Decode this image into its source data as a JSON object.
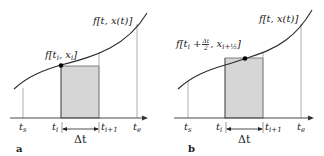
{
  "colors": {
    "curve": "#2a2a2a",
    "axis": "#333333",
    "guide": "#9a9a9a",
    "fill": "#d6d6d6",
    "dot": "#000000"
  },
  "panels": [
    {
      "id": "a",
      "tag": "a",
      "curve_label": "f[t, x(t)]",
      "point_label": "f[t_i, x_i]",
      "method": "left-endpoint (Euler)",
      "ticks": [
        "t_s",
        "t_i",
        "t_i+1",
        "t_e"
      ],
      "interval_label": "Δt"
    },
    {
      "id": "b",
      "tag": "b",
      "curve_label": "f[t, x(t)]",
      "point_label": "f[t_i + Δt/2, x_i+1/2]",
      "method": "midpoint",
      "ticks": [
        "t_s",
        "t_i",
        "t_i+1",
        "t_e"
      ],
      "interval_label": "Δt"
    }
  ],
  "text": {
    "a_tag": "a",
    "b_tag": "b",
    "curve_f": "f[t, x(t)]",
    "a_point_f": "f[t",
    "a_point_i": "i",
    "a_point_x": ", x",
    "a_point_i2": "i",
    "a_point_close": "]",
    "b_point_f": "f[t",
    "b_point_i": "i",
    "b_point_plus": " +",
    "b_frac_num": "Δt",
    "b_frac_den": "2",
    "b_point_x": ", x",
    "b_point_sub": "i+½",
    "b_point_close": "]",
    "t": "t",
    "s": "s",
    "i": "i",
    "ip1": "i+1",
    "e": "e",
    "dt": "Δt"
  }
}
